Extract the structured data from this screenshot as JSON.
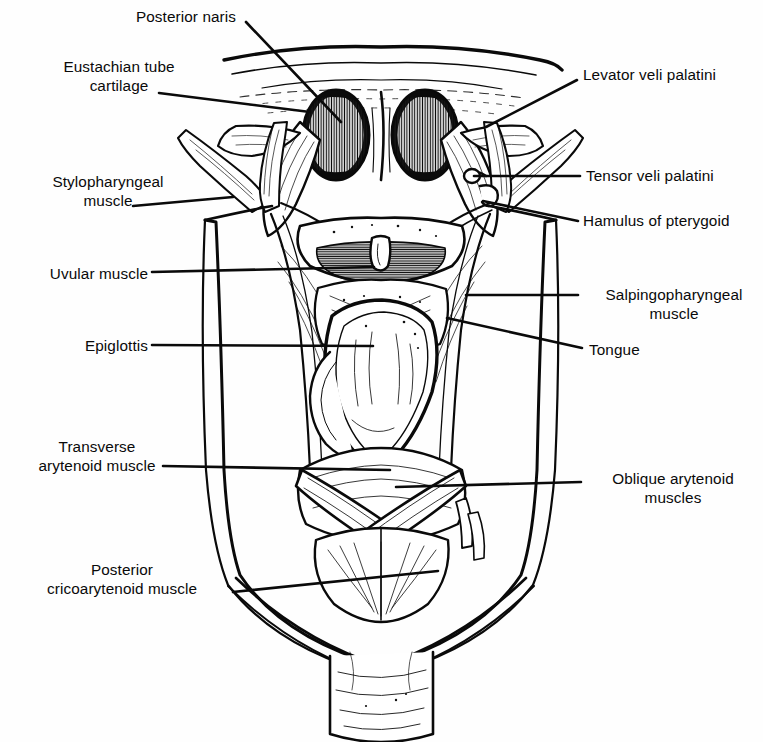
{
  "figure": {
    "kind": "anatomical-line-illustration",
    "style": "black-and-white pen-and-ink engraving with hatching",
    "ink_color": "#0a0a0a",
    "background_color": "#ffffff"
  },
  "labels": [
    {
      "id": "posterior-naris",
      "text": "Posterior naris",
      "side": "left",
      "align": "c",
      "x": 106,
      "y": 8,
      "w": 160
    },
    {
      "id": "eustachian-tube-cartilage",
      "text": "Eustachian tube\ncartilage",
      "side": "left",
      "align": "c",
      "x": 26,
      "y": 58,
      "w": 186
    },
    {
      "id": "stylopharyngeal-muscle",
      "text": "Stylopharyngeal\nmuscle",
      "side": "left",
      "align": "c",
      "x": 22,
      "y": 173,
      "w": 172
    },
    {
      "id": "uvular-muscle",
      "text": "Uvular muscle",
      "side": "left",
      "align": "r",
      "x": 10,
      "y": 265,
      "w": 138
    },
    {
      "id": "epiglottis",
      "text": "Epiglottis",
      "side": "left",
      "align": "r",
      "x": 10,
      "y": 337,
      "w": 138
    },
    {
      "id": "transverse-arytenoid-muscle",
      "text": "Transverse\narytenoid muscle",
      "side": "left",
      "align": "c",
      "x": 12,
      "y": 438,
      "w": 170
    },
    {
      "id": "posterior-cricoarytenoid-muscle",
      "text": "Posterior\ncricoarytenoid muscle",
      "side": "left",
      "align": "c",
      "x": 16,
      "y": 561,
      "w": 212
    },
    {
      "id": "levator-veli-palatini",
      "text": "Levator veli palatini",
      "side": "right",
      "align": "l",
      "x": 583,
      "y": 66,
      "w": 180
    },
    {
      "id": "tensor-veli-palatini",
      "text": "Tensor veli palatini",
      "side": "right",
      "align": "l",
      "x": 586,
      "y": 167,
      "w": 180
    },
    {
      "id": "hamulus-of-pterygoid",
      "text": "Hamulus of pterygoid",
      "side": "right",
      "align": "l",
      "x": 583,
      "y": 212,
      "w": 182
    },
    {
      "id": "salpingopharyngeal-muscle",
      "text": "Salpingopharyngeal\nmuscle",
      "side": "right",
      "align": "c",
      "x": 584,
      "y": 286,
      "w": 180
    },
    {
      "id": "tongue",
      "text": "Tongue",
      "side": "right",
      "align": "l",
      "x": 589,
      "y": 341,
      "w": 120
    },
    {
      "id": "oblique-arytenoid-muscles",
      "text": "Oblique arytenoid\nmuscles",
      "side": "right",
      "align": "c",
      "x": 586,
      "y": 470,
      "w": 174
    }
  ],
  "leaders": [
    {
      "id": "leader-posterior-naris",
      "from": [
        246,
        22
      ],
      "to": [
        341,
        122
      ]
    },
    {
      "id": "leader-eustachian-tube-cartilage",
      "from": [
        159,
        93
      ],
      "to": [
        310,
        112
      ]
    },
    {
      "id": "leader-stylopharyngeal-muscle",
      "from": [
        133,
        206
      ],
      "to": [
        233,
        197
      ]
    },
    {
      "id": "leader-uvular-muscle",
      "from": [
        152,
        272
      ],
      "to": [
        374,
        267
      ]
    },
    {
      "id": "leader-epiglottis",
      "from": [
        152,
        345
      ],
      "to": [
        373,
        346
      ]
    },
    {
      "id": "leader-transverse-arytenoid-muscle",
      "from": [
        163,
        466
      ],
      "to": [
        390,
        470
      ]
    },
    {
      "id": "leader-posterior-cricoarytenoid-muscle",
      "from": [
        233,
        592
      ],
      "to": [
        438,
        571
      ]
    },
    {
      "id": "leader-levator-veli-palatini",
      "from": [
        577,
        80
      ],
      "to": [
        486,
        127
      ]
    },
    {
      "id": "leader-tensor-veli-palatini",
      "from": [
        580,
        176
      ],
      "to": [
        474,
        176
      ]
    },
    {
      "id": "leader-hamulus-of-pterygoid",
      "from": [
        578,
        221
      ],
      "to": [
        483,
        201
      ]
    },
    {
      "id": "leader-salpingopharyngeal-muscle",
      "from": [
        578,
        295
      ],
      "to": [
        466,
        295
      ]
    },
    {
      "id": "leader-tongue",
      "from": [
        582,
        348
      ],
      "to": [
        447,
        318
      ]
    },
    {
      "id": "leader-oblique-arytenoid-muscles",
      "from": [
        581,
        482
      ],
      "to": [
        396,
        487
      ]
    }
  ]
}
